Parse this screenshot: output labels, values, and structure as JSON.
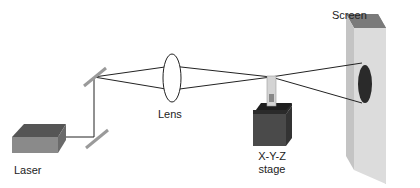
{
  "labels": {
    "laser": "Laser",
    "lens": "Lens",
    "stage_line1": "X-Y-Z",
    "stage_line2": "stage",
    "screen": "Screen"
  },
  "colors": {
    "beam": "#222222",
    "mirror": "#9a9a9a",
    "laser_top": "#555555",
    "laser_front": "#8a8a8a",
    "laser_side": "#6a6a6a",
    "stage_top": "#1e1e1e",
    "stage_front": "#4a4a4a",
    "stage_side": "#333333",
    "sample": "#d4d4d4",
    "screen_face": "#dcdcdc",
    "screen_edge": "#8a8a8a",
    "spot": "#2a2a2a"
  }
}
